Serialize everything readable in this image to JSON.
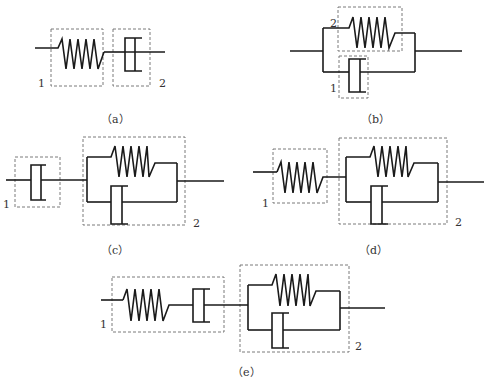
{
  "figure": {
    "panels": [
      {
        "id": "a",
        "caption": "（a）",
        "description": "Spring (element 1) in series with dashpot (element 2) — Maxwell model",
        "labels": {
          "element1": "1",
          "element2": "2"
        }
      },
      {
        "id": "b",
        "caption": "（b）",
        "description": "Spring (element 2) in parallel with dashpot (element 1) — Kelvin-Voigt model",
        "labels": {
          "element1": "1",
          "element2": "2"
        }
      },
      {
        "id": "c",
        "caption": "（c）",
        "description": "Dashpot (element 1) in series with parallel spring-dashpot unit (element 2)",
        "labels": {
          "element1": "1",
          "element2": "2"
        }
      },
      {
        "id": "d",
        "caption": "（d）",
        "description": "Spring (element 1) in series with parallel spring-dashpot unit (element 2)",
        "labels": {
          "element1": "1",
          "element2": "2"
        }
      },
      {
        "id": "e",
        "caption": "（e）",
        "description": "Series spring-dashpot (element 1) in series with parallel spring-dashpot unit (element 2) — Burgers model",
        "labels": {
          "element1": "1",
          "element2": "2"
        }
      }
    ],
    "colors": {
      "line": "#1a1a1a",
      "dashed_box": "#6b6b6b",
      "text": "#333333",
      "background": "#ffffff"
    }
  }
}
